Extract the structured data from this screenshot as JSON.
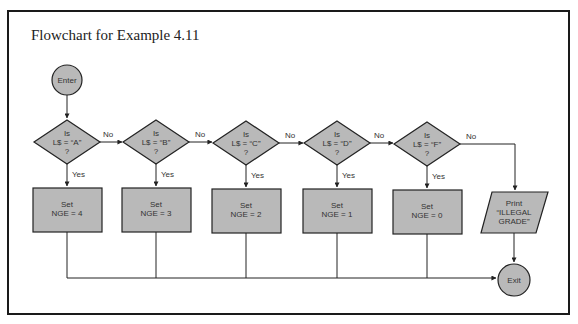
{
  "figure": {
    "title": "Flowchart for Example 4.11"
  },
  "colors": {
    "shape_fill": "#b9b9b9",
    "stroke": "#222222",
    "background": "#ffffff"
  },
  "start": {
    "label": "Enter"
  },
  "end": {
    "label": "Exit"
  },
  "decisions": [
    {
      "line1": "Is",
      "line2": "L$ = “A”",
      "line3": "?",
      "yes": "Yes",
      "no": "No"
    },
    {
      "line1": "Is",
      "line2": "L$ = “B”",
      "line3": "?",
      "yes": "Yes",
      "no": "No"
    },
    {
      "line1": "Is",
      "line2": "L$ = “C”",
      "line3": "?",
      "yes": "Yes",
      "no": "No"
    },
    {
      "line1": "Is",
      "line2": "L$ = “D”",
      "line3": "?",
      "yes": "Yes",
      "no": "No"
    },
    {
      "line1": "Is",
      "line2": "L$ = “F”",
      "line3": "?",
      "yes": "Yes",
      "no": "No"
    }
  ],
  "processes": [
    {
      "line1": "Set",
      "line2": "NGE = 4"
    },
    {
      "line1": "Set",
      "line2": "NGE = 3"
    },
    {
      "line1": "Set",
      "line2": "NGE = 2"
    },
    {
      "line1": "Set",
      "line2": "NGE = 1"
    },
    {
      "line1": "Set",
      "line2": "NGE = 0"
    }
  ],
  "output": {
    "line1": "Print",
    "line2": "“ILLEGAL",
    "line3": "GRADE”"
  }
}
